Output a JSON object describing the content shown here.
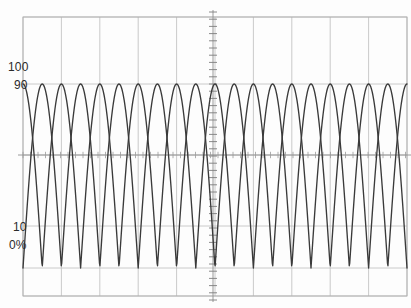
{
  "chart_data": {
    "type": "line",
    "title": "",
    "subtitle": "",
    "xlabel": "",
    "ylabel": "",
    "grid": true,
    "legend": null,
    "legend_position": "none",
    "xlim": [
      0,
      10
    ],
    "ylim": [
      0,
      100
    ],
    "yticks": [
      0,
      10,
      90,
      100
    ],
    "ytick_labels": [
      "0%",
      "10",
      "90",
      "100"
    ],
    "xticks": [
      0,
      1,
      2,
      3,
      4,
      5,
      6,
      7,
      8,
      9,
      10
    ],
    "xtick_labels": [
      "",
      "",
      "",
      "",
      "",
      "",
      "",
      "",
      "",
      "",
      ""
    ],
    "series": [
      {
        "name": "trace-a",
        "form": "rectified-sine",
        "phase_deg": 0,
        "period_units": 1.0,
        "amplitude_pct": 100,
        "offset_pct": 0,
        "color": "#3a3a3a"
      },
      {
        "name": "trace-b",
        "form": "rectified-sine",
        "phase_deg": 180,
        "period_units": 1.0,
        "amplitude_pct": 100,
        "offset_pct": 0,
        "color": "#3a3a3a"
      }
    ],
    "cycles_visible": 10,
    "peak_value_pct": 100,
    "trough_value_pct": 0
  },
  "axis_labels": {
    "upper_major": "100",
    "upper_minor": "90",
    "lower_minor": "10",
    "lower_major": "0%"
  },
  "colors": {
    "background": "#fdfdfd",
    "grid": "#b9b9b9",
    "grid_minor": "#cfcfcf",
    "axis": "#8f8f8f",
    "trace": "#3a3a3a",
    "text": "#2b2b2b"
  },
  "geometry": {
    "plot_left": 23,
    "plot_right": 407,
    "plot_top": 17,
    "plot_bottom": 296,
    "wave_top_y": 84,
    "wave_bottom_y": 268,
    "center_x": 213,
    "center_y": 155,
    "columns": 10,
    "rows": 4
  }
}
